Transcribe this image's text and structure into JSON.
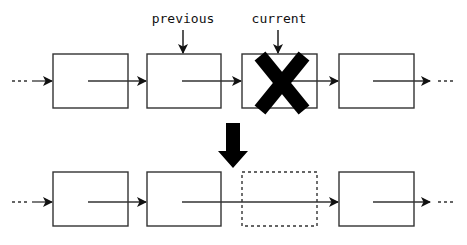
{
  "diagram": {
    "labels": {
      "previous": "previous",
      "current": "current"
    },
    "colors": {
      "stroke": "#333333",
      "fill": "#ffffff",
      "mark": "#000000"
    },
    "before": {
      "nodes": [
        "node-1",
        "node-2 (previous)",
        "node-3 (current, deleted)",
        "node-4"
      ],
      "continuation_left": "...",
      "continuation_right": "..."
    },
    "after": {
      "nodes": [
        "node-1",
        "node-2",
        "node-3 (removed, dashed)",
        "node-4"
      ],
      "bypass": "node-2 links directly to node-4"
    }
  }
}
